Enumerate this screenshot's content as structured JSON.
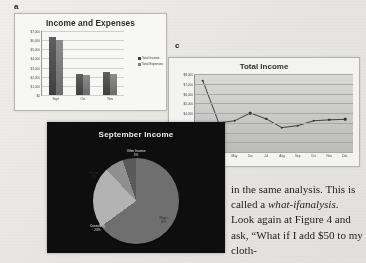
{
  "callouts": {
    "a": "a",
    "c": "c"
  },
  "figure_a": {
    "title": "Income and Expenses",
    "legend": [
      "Total Income",
      "Total Expenses"
    ]
  },
  "figure_b": {
    "title": "September Income",
    "labels": {
      "other": "Other Income",
      "other_pct": "5%",
      "interest": "Interest",
      "interest_pct": "7%",
      "consulting": "Consulting",
      "consulting_pct": "23%",
      "wages": "Wages",
      "wages_pct": "65%"
    }
  },
  "figure_c": {
    "title": "Total Income"
  },
  "body_text": {
    "line1": "in the same analysis.",
    "line2a": "This is called a ",
    "line2b": "what-if",
    "line3a": "analysis",
    "line3b": ". Look again at",
    "line4": "Figure 4 and ask, “What",
    "line5": "if I add $50 to my cloth-"
  },
  "chart_data": [
    {
      "type": "bar",
      "title": "Income and Expenses",
      "categories": [
        "Sept",
        "Oct",
        "Nov"
      ],
      "series": [
        {
          "name": "Total Income",
          "values": [
            6400,
            2300,
            2550
          ]
        },
        {
          "name": "Total Expenses",
          "values": [
            6000,
            2150,
            2300
          ]
        }
      ],
      "xlabel": "",
      "ylabel": "",
      "ylim": [
        0,
        7000
      ],
      "yticks": [
        0,
        1000,
        2000,
        3000,
        4000,
        5000,
        6000,
        7000
      ],
      "ytick_labels": [
        "$0",
        "$1,000",
        "$2,000",
        "$3,000",
        "$4,000",
        "$5,000",
        "$6,000",
        "$7,000"
      ],
      "grid": true,
      "legend_position": "right"
    },
    {
      "type": "pie",
      "title": "September Income",
      "labels": [
        "Wages",
        "Consulting",
        "Interest",
        "Other Income"
      ],
      "values": [
        65,
        23,
        7,
        5
      ],
      "value_suffix": "%",
      "legend_position": "none"
    },
    {
      "type": "line",
      "title": "Total Income",
      "x": [
        "Mar",
        "Apr",
        "May",
        "Jun",
        "Jul",
        "Aug",
        "Sep",
        "Oct",
        "Nov",
        "Dec"
      ],
      "values": [
        7300,
        3000,
        3200,
        4000,
        3400,
        2500,
        2700,
        3200,
        3300,
        3350
      ],
      "xlabel": "",
      "ylabel": "",
      "ylim": [
        0,
        8000
      ],
      "yticks": [
        0,
        1000,
        2000,
        3000,
        4000,
        5000,
        6000,
        7000,
        8000
      ],
      "ytick_labels": [
        "$0",
        "$1,000",
        "$2,000",
        "$3,000",
        "$4,000",
        "$5,000",
        "$6,000",
        "$7,000",
        "$8,000"
      ],
      "grid": true,
      "legend_position": "none"
    }
  ]
}
